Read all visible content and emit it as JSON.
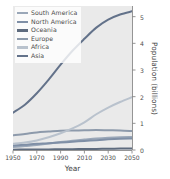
{
  "figure": {
    "background_color": "#ffffff",
    "panel_color": "#eaeaea",
    "grid_color": "#ffffff"
  },
  "legend": {
    "position": "upper-left",
    "entries": [
      {
        "label": "South America",
        "color": "#9aa7b8"
      },
      {
        "label": "North America",
        "color": "#7f8fa6"
      },
      {
        "label": "Oceania",
        "color": "#5e6b7e"
      },
      {
        "label": "Europe",
        "color": "#8d9aab"
      },
      {
        "label": "Africa",
        "color": "#b9c2cd"
      },
      {
        "label": "Asia",
        "color": "#63728a"
      }
    ]
  },
  "axes": {
    "x": {
      "title": "Year",
      "ticks": [
        "1950",
        "1970",
        "1990",
        "2010",
        "2030",
        "2050"
      ],
      "min": 1950,
      "max": 2050
    },
    "y": {
      "title": "Population (billions)",
      "ticks": [
        "0",
        "1",
        "2",
        "3",
        "4",
        "5"
      ],
      "min": 0,
      "max": 5.4,
      "side": "right"
    }
  },
  "chart_data": {
    "type": "line",
    "title": "",
    "xlabel": "Year",
    "ylabel": "Population (billions)",
    "xlim": [
      1950,
      2050
    ],
    "ylim": [
      0,
      5.4
    ],
    "grid": false,
    "legend_position": "upper-left",
    "x": [
      1950,
      1960,
      1970,
      1980,
      1990,
      2000,
      2010,
      2020,
      2030,
      2040,
      2050
    ],
    "series": [
      {
        "name": "Asia",
        "color": "#63728a",
        "values": [
          1.4,
          1.7,
          2.13,
          2.64,
          3.2,
          3.72,
          4.17,
          4.59,
          4.89,
          5.08,
          5.2
        ]
      },
      {
        "name": "Africa",
        "color": "#b9c2cd",
        "values": [
          0.23,
          0.28,
          0.36,
          0.48,
          0.63,
          0.81,
          1.04,
          1.34,
          1.59,
          1.8,
          1.98
        ]
      },
      {
        "name": "Europe",
        "color": "#8d9aab",
        "values": [
          0.55,
          0.6,
          0.66,
          0.69,
          0.72,
          0.73,
          0.74,
          0.75,
          0.74,
          0.73,
          0.71
        ]
      },
      {
        "name": "North America",
        "color": "#7f8fa6",
        "values": [
          0.17,
          0.2,
          0.23,
          0.25,
          0.28,
          0.31,
          0.34,
          0.37,
          0.4,
          0.42,
          0.43
        ]
      },
      {
        "name": "South America",
        "color": "#9aa7b8",
        "values": [
          0.11,
          0.15,
          0.19,
          0.24,
          0.3,
          0.35,
          0.39,
          0.43,
          0.46,
          0.48,
          0.49
        ]
      },
      {
        "name": "Oceania",
        "color": "#5e6b7e",
        "values": [
          0.013,
          0.016,
          0.019,
          0.023,
          0.027,
          0.031,
          0.037,
          0.042,
          0.047,
          0.052,
          0.057
        ]
      }
    ]
  }
}
